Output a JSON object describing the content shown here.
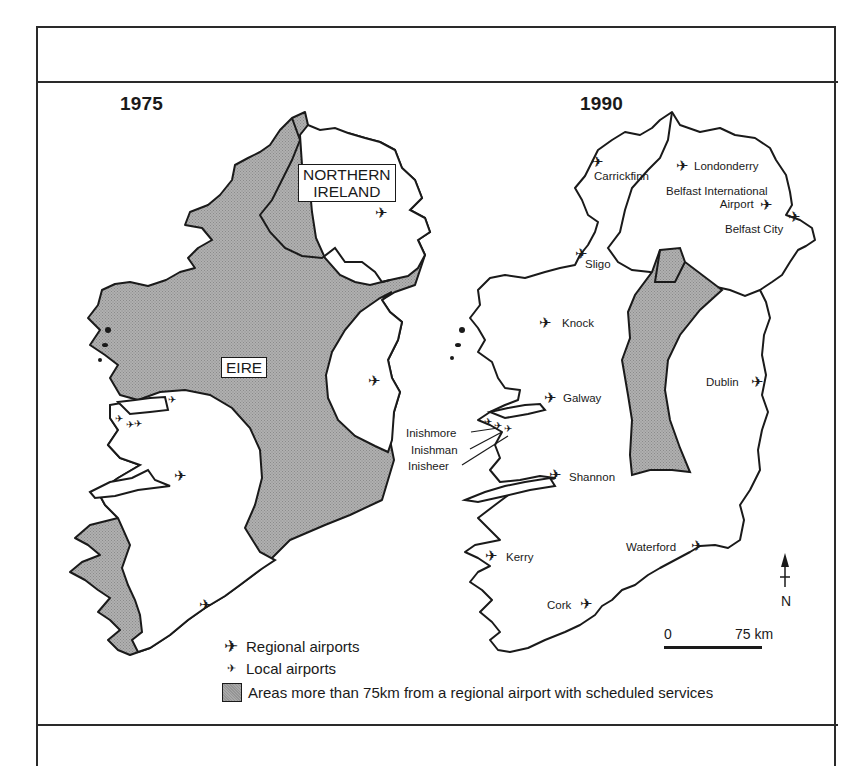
{
  "figure": {
    "frame_color": "#2a2a2a",
    "shade_color": "#a9a9a9",
    "line_color": "#1a1a1a"
  },
  "maps": [
    {
      "year": "1975",
      "region_labels": [
        {
          "text_line1": "NORTHERN",
          "text_line2": "IRELAND",
          "name": "northern-ireland-label"
        },
        {
          "text_line1": "EIRE",
          "text_line2": "",
          "name": "eire-label"
        }
      ],
      "airports": [
        {
          "type": "regional",
          "x": 382,
          "y": 213
        },
        {
          "type": "regional",
          "x": 375,
          "y": 381
        },
        {
          "type": "local",
          "x": 173,
          "y": 401
        },
        {
          "type": "local",
          "x": 120,
          "y": 420
        },
        {
          "type": "local",
          "x": 131,
          "y": 426
        },
        {
          "type": "local",
          "x": 139,
          "y": 425
        },
        {
          "type": "regional",
          "x": 181,
          "y": 476
        },
        {
          "type": "regional",
          "x": 206,
          "y": 605
        }
      ]
    },
    {
      "year": "1990",
      "airports": [
        {
          "type": "regional",
          "name": "Carrickfinn",
          "x": 598,
          "y": 162,
          "label_x": 594,
          "label_y": 170
        },
        {
          "type": "regional",
          "name": "Londonderry",
          "x": 683,
          "y": 166,
          "label_x": 694,
          "label_y": 160
        },
        {
          "type": "regional",
          "name": "Belfast International Airport",
          "label_line1": "Belfast International",
          "label_line2": "Airport",
          "x": 767,
          "y": 205,
          "label_x": 666,
          "label_y": 185
        },
        {
          "type": "regional",
          "name": "Belfast City",
          "x": 795,
          "y": 217,
          "label_x": 725,
          "label_y": 223
        },
        {
          "type": "regional",
          "name": "Sligo",
          "x": 582,
          "y": 254,
          "label_x": 585,
          "label_y": 258
        },
        {
          "type": "regional",
          "name": "Knock",
          "x": 546,
          "y": 323,
          "label_x": 562,
          "label_y": 317
        },
        {
          "type": "regional",
          "name": "Galway",
          "x": 551,
          "y": 398,
          "label_x": 563,
          "label_y": 392
        },
        {
          "type": "local",
          "name": "Inishmore",
          "x": 489,
          "y": 423,
          "label_x": 406,
          "label_y": 427
        },
        {
          "type": "local",
          "name": "Inishman",
          "x": 499,
          "y": 427,
          "label_x": 411,
          "label_y": 444
        },
        {
          "type": "local",
          "name": "Inisheer",
          "x": 509,
          "y": 430,
          "label_x": 408,
          "label_y": 460
        },
        {
          "type": "regional",
          "name": "Shannon",
          "x": 556,
          "y": 475,
          "label_x": 569,
          "label_y": 471
        },
        {
          "type": "regional",
          "name": "Dublin",
          "x": 758,
          "y": 382,
          "label_x": 706,
          "label_y": 376
        },
        {
          "type": "regional",
          "name": "Kerry",
          "x": 492,
          "y": 556,
          "label_x": 506,
          "label_y": 551
        },
        {
          "type": "regional",
          "name": "Waterford",
          "x": 698,
          "y": 546,
          "label_x": 626,
          "label_y": 541
        },
        {
          "type": "regional",
          "name": "Cork",
          "x": 587,
          "y": 604,
          "label_x": 547,
          "label_y": 599
        }
      ]
    }
  ],
  "legend": {
    "items": [
      {
        "symbol": "regional-airport",
        "glyph": "✈",
        "label": "Regional airports"
      },
      {
        "symbol": "local-airport",
        "glyph": "✈",
        "label": "Local airports"
      },
      {
        "symbol": "shaded-area",
        "glyph": "",
        "label": "Areas more than 75km from a regional airport with scheduled services"
      }
    ]
  },
  "scale_bar": {
    "start_label": "0",
    "end_label": "75 km"
  },
  "north_arrow": {
    "label": "N"
  }
}
